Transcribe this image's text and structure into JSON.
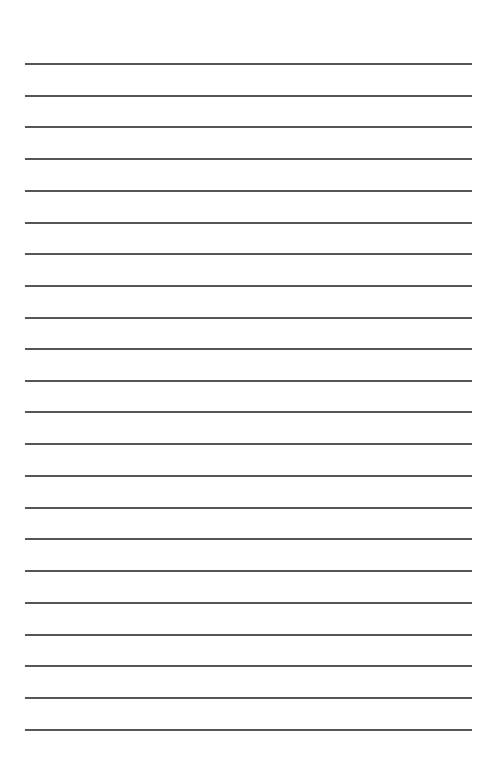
{
  "page": {
    "type": "lined-paper",
    "background": "#ffffff",
    "rule_color": "#555555",
    "rule_left": 25,
    "rule_width": 447,
    "rule_count": 22,
    "rule_positions": [
      63,
      95,
      126,
      158,
      190,
      222,
      253,
      285,
      317,
      348,
      380,
      411,
      443,
      475,
      507,
      538,
      570,
      602,
      634,
      665,
      697,
      729
    ]
  }
}
